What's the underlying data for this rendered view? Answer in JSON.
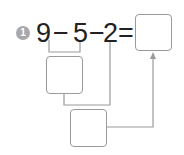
{
  "problem": {
    "number": "1",
    "tokens": [
      "9",
      "−",
      "5",
      "−",
      "2",
      "="
    ],
    "operands": [
      9,
      5,
      2
    ],
    "operators": [
      "−",
      "−"
    ],
    "answer_box": "",
    "intermediate_box_1": "",
    "intermediate_box_2": ""
  },
  "colors": {
    "badge": "#a8a8a8",
    "text": "#222222",
    "lines": "#9a9a9a"
  }
}
